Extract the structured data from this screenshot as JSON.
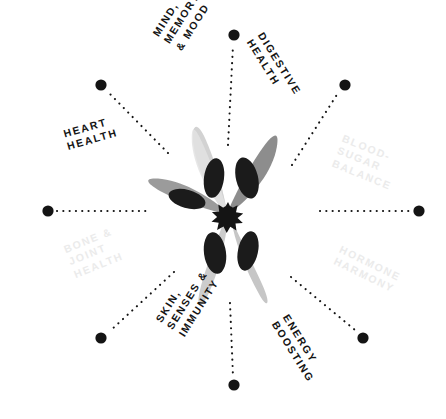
{
  "diagram": {
    "type": "radial-benefit-wheel",
    "center_icon": "flower-starburst-icon",
    "background_color": "#ffffff",
    "spoke_count": 12,
    "label_color_dark": "#141414",
    "label_color_faded": "#ebebeb",
    "dot_color": "#141414",
    "petal_colors": [
      "#8a8a8a",
      "#dcdcdc",
      "#9a9a9a",
      "#c9c9c9",
      "#d6d6d6"
    ],
    "petal_inner_color": "#1b1b1b"
  },
  "labels": [
    {
      "id": "heart-health",
      "text": "Heart\nHealth",
      "state": "active",
      "angle_deg": 200,
      "dot": {
        "x": 48,
        "y": 211
      }
    },
    {
      "id": "mind-memory-mood",
      "text": "Mind,\nMemory\n& Mood",
      "state": "active",
      "angle_deg": 255,
      "dot": {
        "x": 101,
        "y": 85
      }
    },
    {
      "id": "digestive-health",
      "text": "Digestive\nHealth",
      "state": "active",
      "angle_deg": 285,
      "dot": {
        "x": 345,
        "y": 85
      }
    },
    {
      "id": "blood-sugar-balance",
      "text": "Blood-\nSugar\nBalance",
      "state": "inactive",
      "angle_deg": 340,
      "dot": {
        "x": 419,
        "y": 211
      }
    },
    {
      "id": "hormone-harmony",
      "text": "Hormone\nHarmony",
      "state": "inactive",
      "angle_deg": 20,
      "dot": {
        "x": 363,
        "y": 338
      }
    },
    {
      "id": "energy-boosting",
      "text": "Energy\nBoosting",
      "state": "active",
      "angle_deg": 70,
      "dot": {
        "x": 234,
        "y": 385
      }
    },
    {
      "id": "skin-senses-immunity",
      "text": "Skin,\nSenses &\nImmunity",
      "state": "active",
      "angle_deg": 110,
      "dot": {
        "x": 101,
        "y": 338
      }
    },
    {
      "id": "bone-joint-health",
      "text": "Bone &\nJoint\nHealth",
      "state": "inactive",
      "angle_deg": 160,
      "dot": {
        "x": 234,
        "y": 35
      }
    }
  ],
  "spokes": [
    {
      "id": "spoke-n",
      "dot": {
        "x": 234,
        "y": 35
      }
    },
    {
      "id": "spoke-nne",
      "dot": {
        "x": 345,
        "y": 85
      }
    },
    {
      "id": "spoke-ene",
      "dot": {
        "x": 419,
        "y": 211
      }
    },
    {
      "id": "spoke-ese",
      "dot": {
        "x": 363,
        "y": 338
      }
    },
    {
      "id": "spoke-s",
      "dot": {
        "x": 234,
        "y": 385
      }
    },
    {
      "id": "spoke-wsw",
      "dot": {
        "x": 101,
        "y": 338
      }
    },
    {
      "id": "spoke-w",
      "dot": {
        "x": 48,
        "y": 211
      }
    },
    {
      "id": "spoke-nnw",
      "dot": {
        "x": 101,
        "y": 85
      }
    }
  ]
}
